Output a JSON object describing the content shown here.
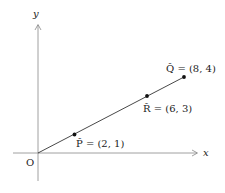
{
  "diagram": {
    "axes": {
      "x_label": "x",
      "y_label": "y",
      "origin_label": "O"
    },
    "points": [
      {
        "name": "P",
        "label": "(2, 1)",
        "display": "P̂ = (2, 1)",
        "coord": [
          2,
          1
        ]
      },
      {
        "name": "R",
        "label": "(6, 3)",
        "display": "R̂ = (6, 3)",
        "coord": [
          6,
          3
        ]
      },
      {
        "name": "Q",
        "label": "(8, 4)",
        "display": "Q̂ = (8, 4)",
        "coord": [
          8,
          4
        ]
      }
    ],
    "segment": {
      "from": "O",
      "to": "Q"
    },
    "colors": {
      "line": "#333333",
      "axis": "#777777",
      "point": "#111111"
    }
  }
}
